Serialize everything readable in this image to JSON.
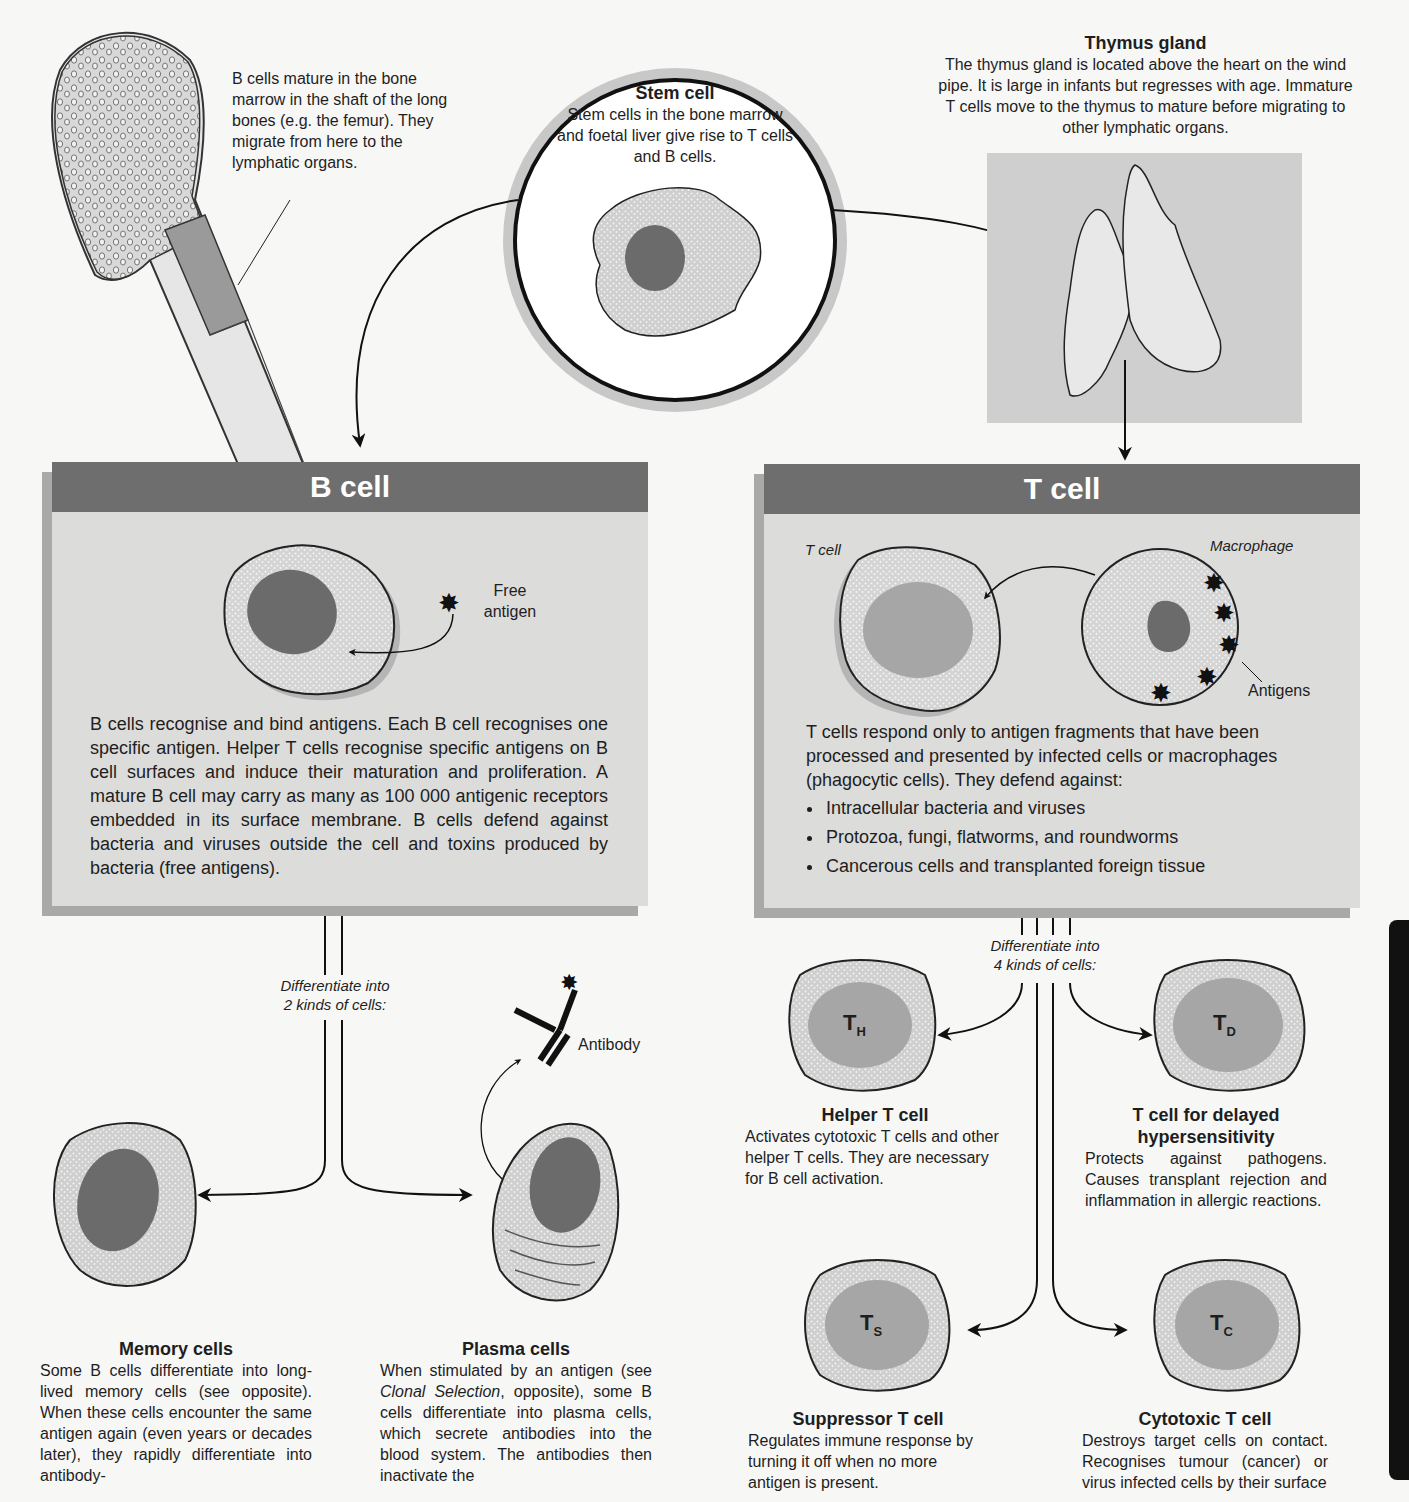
{
  "bone": {
    "caption": "B cells mature in the bone marrow in the shaft of the long bones (e.g. the femur). They migrate from here to the lymphatic organs."
  },
  "stem_cell": {
    "title": "Stem cell",
    "text": "Stem cells in the bone marrow and foetal liver give rise to T cells and B cells."
  },
  "thymus": {
    "title": "Thymus gland",
    "text": "The thymus gland is located above the heart on the wind pipe. It is large in infants but regresses with age. Immature T cells move to the thymus to mature before migrating to other lymphatic organs."
  },
  "b_panel": {
    "header": "B cell",
    "free_antigen_label": "Free antigen",
    "text": "B cells recognise and bind antigens. Each B cell recognises one specific antigen. Helper T cells recognise specific antigens on B cell surfaces and induce their maturation and proliferation. A mature B cell may carry as many as 100 000 antigenic receptors embedded in its surface membrane. B cells defend against bacteria and viruses outside the cell and toxins produced by bacteria (free antigens)."
  },
  "t_panel": {
    "header": "T cell",
    "t_cell_label": "T cell",
    "macrophage_label": "Macrophage",
    "antigens_label": "Antigens",
    "text": "T cells respond only to antigen fragments that have been processed and presented by infected cells or macrophages (phagocytic cells). They defend against:",
    "bullets": [
      "Intracellular bacteria and viruses",
      "Protozoa, fungi, flatworms, and roundworms",
      "Cancerous cells and transplanted foreign tissue"
    ]
  },
  "b_diff": {
    "line1": "Differentiate into",
    "line2": "2 kinds of cells:",
    "antibody_label": "Antibody",
    "memory": {
      "title": "Memory cells",
      "text": "Some B cells differentiate into long-lived memory cells (see opposite). When these cells encounter the same antigen again (even years or decades later), they rapidly differentiate into antibody-"
    },
    "plasma": {
      "title": "Plasma cells",
      "text_pre": "When stimulated by an antigen (see ",
      "text_italic": "Clonal Selection",
      "text_post": ", opposite), some B cells differentiate into plasma cells, which secrete antibodies into the blood system. The antibodies then inactivate the"
    }
  },
  "t_diff": {
    "line1": "Differentiate into",
    "line2": "4 kinds of cells:",
    "helper": {
      "symbol": "T",
      "sub": "H",
      "title": "Helper T cell",
      "text": "Activates cytotoxic T cells and other helper T cells. They are necessary for B cell activation."
    },
    "delayed": {
      "symbol": "T",
      "sub": "D",
      "title1": "T cell for delayed",
      "title2": "hypersensitivity",
      "text": "Protects against pathogens. Causes transplant rejection and inflammation in allergic reactions."
    },
    "suppressor": {
      "symbol": "T",
      "sub": "S",
      "title": "Suppressor T cell",
      "text": "Regulates immune response by turning it off when no more antigen is present."
    },
    "cytotoxic": {
      "symbol": "T",
      "sub": "C",
      "title": "Cytotoxic T cell",
      "text": "Destroys target cells on contact. Recognises tumour (cancer) or virus infected cells by their surface"
    }
  },
  "colors": {
    "panel_header": "#6e6e6e",
    "panel_body": "#dcdcdb",
    "panel_shadow": "#a9a9a8",
    "nucleus_dark": "#6b6b6b",
    "nucleus_light": "#a6a6a6",
    "cytoplasm": "#d2d2d2"
  }
}
